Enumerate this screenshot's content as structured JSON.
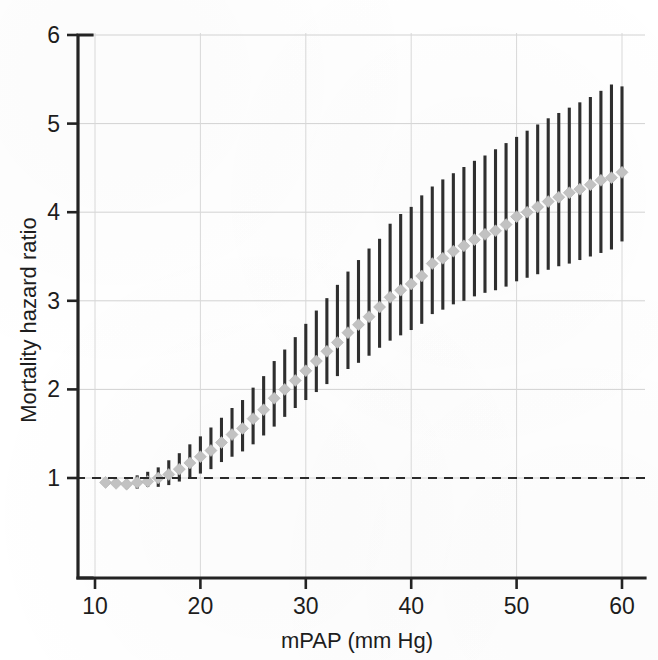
{
  "figure": {
    "name": "mortality-hazard-ratio-vs-mpap",
    "background_color": "#ffffff"
  },
  "chart_data": {
    "type": "scatter",
    "title": "",
    "subtitle": "",
    "xlabel": "mPAP (mm Hg)",
    "ylabel": "Mortality hazard ratio",
    "xlim": [
      9.2,
      61.0
    ],
    "ylim": [
      0.35,
      6.0
    ],
    "xticks": [
      10,
      20,
      30,
      40,
      50,
      60
    ],
    "xtick_labels": [
      "10",
      "20",
      "30",
      "40",
      "50",
      "60"
    ],
    "yticks": [
      1,
      2,
      3,
      4,
      5,
      6
    ],
    "ytick_labels": [
      "1",
      "2",
      "3",
      "4",
      "5",
      "6"
    ],
    "grid": "major-horizontal-and-vertical-light",
    "legend": "none",
    "reference_line": {
      "name": "null-effect-line",
      "y": 1,
      "style": "dashed",
      "color": "#2a2a2a"
    },
    "marker_style": {
      "shape": "diamond",
      "fill_color": "#c2c2c2",
      "size_px": 11
    },
    "errorbar_style": {
      "color": "#2e2e2e",
      "width_px": 3,
      "caps": false,
      "meaning": "95% confidence interval"
    },
    "x": [
      11,
      12,
      13,
      14,
      15,
      16,
      17,
      18,
      19,
      20,
      21,
      22,
      23,
      24,
      25,
      26,
      27,
      28,
      29,
      30,
      31,
      32,
      33,
      34,
      35,
      36,
      37,
      38,
      39,
      40,
      41,
      42,
      43,
      44,
      45,
      46,
      47,
      48,
      49,
      50,
      51,
      52,
      53,
      54,
      55,
      56,
      57,
      58,
      59,
      60
    ],
    "y": [
      0.95,
      0.94,
      0.93,
      0.95,
      0.96,
      1.0,
      1.04,
      1.1,
      1.17,
      1.24,
      1.31,
      1.4,
      1.49,
      1.56,
      1.67,
      1.77,
      1.9,
      2.0,
      2.1,
      2.21,
      2.32,
      2.43,
      2.53,
      2.64,
      2.73,
      2.82,
      2.93,
      3.04,
      3.12,
      3.19,
      3.28,
      3.42,
      3.48,
      3.56,
      3.62,
      3.69,
      3.75,
      3.79,
      3.86,
      3.95,
      4.0,
      4.06,
      4.12,
      4.17,
      4.22,
      4.26,
      4.31,
      4.36,
      4.39,
      4.45
    ],
    "ci_lower": [
      0.93,
      0.9,
      0.88,
      0.88,
      0.9,
      0.9,
      0.92,
      0.96,
      1.0,
      1.05,
      1.1,
      1.18,
      1.24,
      1.3,
      1.38,
      1.48,
      1.58,
      1.69,
      1.79,
      1.88,
      1.97,
      2.06,
      2.15,
      2.23,
      2.3,
      2.38,
      2.47,
      2.55,
      2.61,
      2.67,
      2.74,
      2.85,
      2.9,
      2.96,
      3.0,
      3.05,
      3.09,
      3.12,
      3.16,
      3.22,
      3.26,
      3.3,
      3.35,
      3.39,
      3.42,
      3.46,
      3.5,
      3.54,
      3.58,
      3.67
    ],
    "ci_upper": [
      0.98,
      0.98,
      0.98,
      1.03,
      1.07,
      1.12,
      1.2,
      1.28,
      1.38,
      1.47,
      1.57,
      1.68,
      1.79,
      1.88,
      2.02,
      2.15,
      2.32,
      2.45,
      2.59,
      2.74,
      2.89,
      3.03,
      3.18,
      3.33,
      3.46,
      3.59,
      3.7,
      3.87,
      3.98,
      4.06,
      4.19,
      4.29,
      4.37,
      4.44,
      4.51,
      4.58,
      4.64,
      4.71,
      4.78,
      4.85,
      4.92,
      4.99,
      5.06,
      5.12,
      5.18,
      5.24,
      5.3,
      5.37,
      5.44,
      5.42
    ],
    "annotations": []
  }
}
